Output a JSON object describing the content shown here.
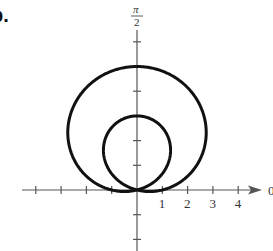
{
  "figure": {
    "part_label": "b.",
    "angle_label_num": "π",
    "angle_label_den": "2",
    "polar_axis_label": "0"
  },
  "chart_data": {
    "type": "line",
    "subtype": "polar",
    "title": "",
    "equation_estimate": "r = 1 + 4 sin θ",
    "series": [
      {
        "name": "limacon",
        "color": "#111111",
        "points_xy": [
          [
            0,
            0
          ],
          [
            1.0,
            0.3
          ],
          [
            2.0,
            1.0
          ],
          [
            2.6,
            2.0
          ],
          [
            2.7,
            3.0
          ],
          [
            2.3,
            4.0
          ],
          [
            1.5,
            4.7
          ],
          [
            0,
            5
          ],
          [
            -1.5,
            4.7
          ],
          [
            -2.3,
            4.0
          ],
          [
            -2.7,
            3.0
          ],
          [
            -2.6,
            2.0
          ],
          [
            -2.0,
            1.0
          ],
          [
            -1.0,
            0.3
          ],
          [
            0,
            0
          ],
          [
            1.3,
            1.5
          ],
          [
            0,
            3
          ],
          [
            -1.3,
            1.5
          ],
          [
            0,
            0
          ]
        ]
      }
    ],
    "x_tick_labels": [
      "1",
      "2",
      "3",
      "4"
    ],
    "x_ticks": [
      -4,
      -3,
      -2,
      -1,
      1,
      2,
      3,
      4
    ],
    "y_ticks": [
      -2,
      -1,
      1,
      2,
      4,
      6
    ],
    "xlim": [
      -4.1,
      5
    ],
    "ylim": [
      -2.5,
      6.5
    ],
    "axis_labels": {
      "polar_axis": "0",
      "vertical_axis": "π/2"
    },
    "grid": false,
    "legend": null
  }
}
